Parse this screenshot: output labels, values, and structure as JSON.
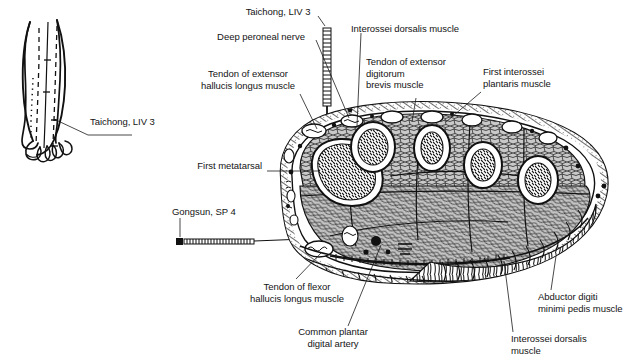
{
  "figure": {
    "title_alt": "Cross-section of the foot at the level of the metatarsals showing acupuncture points Taichong LIV 3 and Gongsun SP 4",
    "background_color": "#ffffff",
    "ink_color": "#1a1a1a",
    "fill_gray": "#c9c9c9"
  },
  "inset": {
    "name": "dorsum-of-foot-outline",
    "label": "Taichong, LIV 3"
  },
  "labels": {
    "taichong_top": "Taichong, LIV 3",
    "deep_peroneal_nerve": "Deep peroneal nerve",
    "interossei_dorsalis_top": "Interossei dorsalis muscle",
    "tendon_ext_hallucis": "Tendon of extensor\nhallucis longus muscle",
    "tendon_ext_digitorum": "Tendon of extensor\ndigitorum\nbrevis muscle",
    "first_interossei_plantaris": "First interossei\nplantaris muscle",
    "first_metatarsal": "First metatarsal",
    "gongsun": "Gongsun, SP 4",
    "tendon_flexor_hallucis": "Tendon of flexor\nhallucis longus muscle",
    "common_plantar_digital_artery": "Common plantar\ndigital artery",
    "interossei_dorsalis_bottom": "Interossei dorsalis\nmuscle",
    "abductor_digiti_minimi": "Abductor digiti\nminimi pedis muscle"
  },
  "acupuncture_points": [
    {
      "name": "Taichong, LIV 3",
      "code": "LIV 3",
      "needle": "vertical",
      "insertion": "dorsal"
    },
    {
      "name": "Gongsun, SP 4",
      "code": "SP 4",
      "needle": "horizontal",
      "insertion": "medial"
    }
  ],
  "anatomy_structures": [
    "Deep peroneal nerve",
    "Interossei dorsalis muscle",
    "Tendon of extensor hallucis longus muscle",
    "Tendon of extensor digitorum brevis muscle",
    "First interossei plantaris muscle",
    "First metatarsal",
    "Tendon of flexor hallucis longus muscle",
    "Common plantar digital artery",
    "Abductor digiti minimi pedis muscle"
  ]
}
